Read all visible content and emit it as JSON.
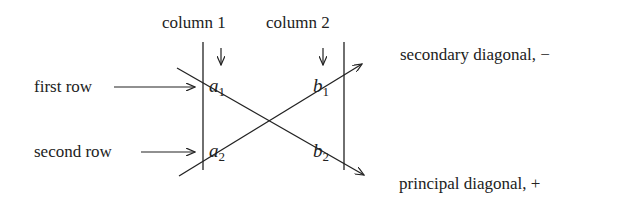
{
  "labels": {
    "column1": "column 1",
    "column2": "column 2",
    "first_row": "first row",
    "second_row": "second row",
    "secondary_diagonal": "secondary diagonal, −",
    "principal_diagonal": "principal diagonal, +"
  },
  "matrix": {
    "a1": {
      "base": "a",
      "sub": "1"
    },
    "b1": {
      "base": "b",
      "sub": "1"
    },
    "a2": {
      "base": "a",
      "sub": "2"
    },
    "b2": {
      "base": "b",
      "sub": "2"
    }
  },
  "colors": {
    "ink": "#222222",
    "background": "#ffffff"
  }
}
